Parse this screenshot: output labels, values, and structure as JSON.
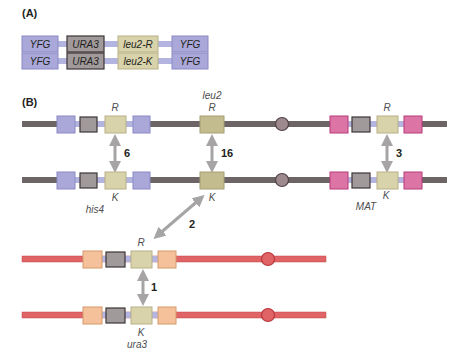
{
  "panels": {
    "a": {
      "label": "(A)",
      "constructs": [
        {
          "yfg_left": "YFG",
          "marker": "URA3",
          "leu2": "leu2-R",
          "yfg_right": "YFG"
        },
        {
          "yfg_left": "YFG",
          "marker": "URA3",
          "leu2": "leu2-K",
          "yfg_right": "YFG"
        }
      ]
    },
    "b": {
      "label": "(B)",
      "loci": {
        "his4": "his4",
        "leu2": "leu2",
        "mat": "MAT",
        "ura3": "ura3"
      },
      "alleles": {
        "his4_top": "R",
        "his4_bottom": "K",
        "leu2_top": "R",
        "leu2_bottom": "K",
        "mat_top": "R",
        "mat_bottom": "K",
        "ura3_top": "R",
        "ura3_bottom": "K"
      },
      "rates": {
        "his4": "6",
        "leu2": "16",
        "mat": "3",
        "ectopic": "2",
        "ura3": "1"
      }
    }
  },
  "colors": {
    "chromosome_gray": "#6d6466",
    "chromosome_red": "#e06366",
    "yfg_blue": "#a9a8d8",
    "ura3_gray": "#a19a9b",
    "leu2_tan": "#d8d3ab",
    "leu2_tan_dark": "#b9b086",
    "mat_pink": "#dc75a6",
    "ura_orange": "#f4c19a",
    "linker_blue": "#b3b4e0",
    "arrow_gray": "#a6a4a5",
    "centromere_gray": "#9d8a8f",
    "centromere_red": "#e06366"
  }
}
